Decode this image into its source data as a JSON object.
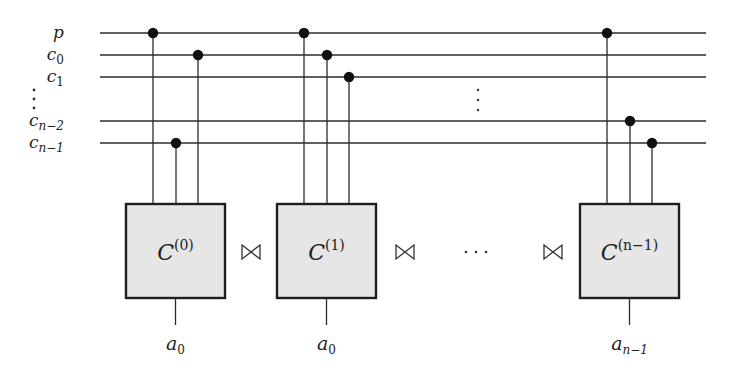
{
  "wires": [
    {
      "id": "p",
      "base": "p",
      "sub": ""
    },
    {
      "id": "c0",
      "base": "c",
      "sub": "0"
    },
    {
      "id": "c1",
      "base": "c",
      "sub": "1"
    },
    {
      "id": "cn2",
      "base": "c",
      "sub": "n−2"
    },
    {
      "id": "cn1",
      "base": "c",
      "sub": "n−1"
    }
  ],
  "wire_ellipsis": "⋮",
  "blocks": [
    {
      "name": "C",
      "sup": "(0)",
      "output_base": "a",
      "output_sub": "0",
      "controls": [
        "p",
        "cn1",
        "c0"
      ]
    },
    {
      "name": "C",
      "sup": "(1)",
      "output_base": "a",
      "output_sub": "0",
      "controls": [
        "p",
        "c0",
        "c1"
      ]
    },
    {
      "name": "C",
      "sup": "(n−1)",
      "output_base": "a",
      "output_sub": "n−1",
      "controls": [
        "p",
        "cn2",
        "cn1"
      ]
    }
  ],
  "join_symbol": "⋈",
  "block_ellipsis": "⋯"
}
